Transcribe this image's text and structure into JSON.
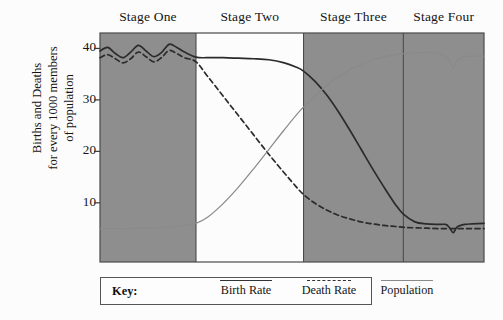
{
  "chart_data": {
    "type": "line",
    "title": "",
    "xlabel": "",
    "ylabel": "Births and Deaths for every 1000 members of population",
    "ylabel_lines": [
      "Births and Deaths",
      "for every 1000 members",
      "of population"
    ],
    "ylim": [
      -1.5,
      43
    ],
    "yticks": [
      10,
      20,
      30,
      40
    ],
    "ytick_labels": [
      "10",
      "20",
      "30",
      "40"
    ],
    "grid": false,
    "legend_position": "below-axes",
    "xlim": [
      0,
      100
    ],
    "stage_labels": [
      "Stage One",
      "Stage Two",
      "Stage Three",
      "Stage Four"
    ],
    "stage_ranges": [
      [
        0,
        25
      ],
      [
        25,
        53
      ],
      [
        53,
        79
      ],
      [
        79,
        100
      ]
    ],
    "shaded_stages": [
      "Stage One",
      "Stage Three",
      "Stage Four"
    ],
    "shade_color": "#8e8e8e",
    "series": [
      {
        "name": "Birth Rate",
        "style": "solid",
        "color": "#2b2b2b",
        "x": [
          0,
          2,
          4,
          6,
          8,
          10,
          12,
          14,
          16,
          18,
          20,
          22,
          25,
          28,
          32,
          36,
          40,
          44,
          48,
          51,
          53,
          56,
          59,
          62,
          65,
          68,
          71,
          74,
          77,
          79,
          82,
          85,
          88,
          90,
          91,
          92,
          93,
          95,
          97,
          100
        ],
        "values": [
          39.5,
          40.2,
          39.0,
          38.2,
          39.3,
          40.6,
          39.5,
          38.4,
          39.2,
          40.8,
          40.2,
          39.3,
          38.3,
          38.2,
          38.2,
          38.1,
          38.0,
          37.8,
          37.2,
          36.4,
          35.6,
          33.6,
          31.0,
          27.8,
          24.2,
          20.4,
          16.6,
          13.0,
          9.6,
          7.8,
          6.3,
          5.9,
          5.8,
          5.8,
          5.2,
          4.2,
          5.3,
          5.8,
          5.9,
          6.0
        ]
      },
      {
        "name": "Death Rate",
        "style": "dashed",
        "color": "#2b2b2b",
        "x": [
          0,
          2,
          4,
          6,
          8,
          10,
          12,
          14,
          16,
          18,
          20,
          22,
          25,
          28,
          32,
          36,
          40,
          44,
          48,
          51,
          53,
          56,
          59,
          62,
          65,
          68,
          71,
          74,
          77,
          80,
          84,
          88,
          92,
          96,
          100
        ],
        "values": [
          38.2,
          38.8,
          38.0,
          37.2,
          38.0,
          39.3,
          38.4,
          37.4,
          38.2,
          39.6,
          39.0,
          38.2,
          37.4,
          34.6,
          30.8,
          27.0,
          23.2,
          19.4,
          15.8,
          13.2,
          11.6,
          9.9,
          8.6,
          7.6,
          6.9,
          6.3,
          5.9,
          5.6,
          5.4,
          5.2,
          5.1,
          5.0,
          5.0,
          5.0,
          5.0
        ]
      },
      {
        "name": "Population",
        "style": "thin",
        "color": "#8a8a8a",
        "x": [
          0,
          6,
          12,
          18,
          22,
          25,
          28,
          32,
          36,
          40,
          44,
          48,
          52,
          56,
          60,
          64,
          68,
          72,
          76,
          79,
          83,
          86,
          88,
          90,
          91,
          92,
          93,
          95,
          97,
          100
        ],
        "values": [
          5.0,
          5.0,
          5.1,
          5.3,
          5.6,
          6.0,
          7.2,
          9.8,
          13.0,
          16.6,
          20.4,
          24.2,
          27.8,
          30.8,
          33.4,
          35.4,
          36.9,
          38.0,
          38.7,
          39.0,
          39.2,
          39.2,
          39.0,
          38.5,
          37.4,
          36.2,
          37.6,
          38.4,
          38.5,
          38.5
        ]
      }
    ]
  },
  "legend": {
    "key_label": "Key:",
    "entries": [
      {
        "label": "Birth Rate",
        "style": "solid"
      },
      {
        "label": "Death Rate",
        "style": "dashed"
      },
      {
        "label": "Population",
        "style": "thin"
      }
    ]
  }
}
